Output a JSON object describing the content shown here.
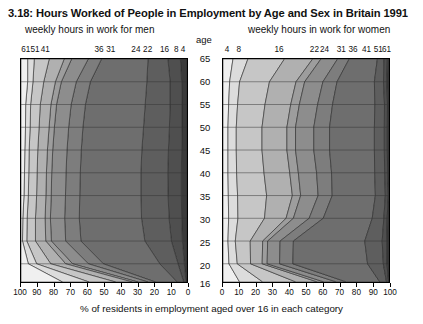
{
  "title": "3.18: Hours Worked of People in Employment by Age and Sex in Britain 1991",
  "captions": {
    "men": "weekly hours in work for men",
    "women": "weekly hours in work for women",
    "age_axis": "age",
    "x_caption": "% of residents in employment aged over 16 in each category"
  },
  "chart_data": {
    "type": "area",
    "title": "3.18: Hours Worked of People in Employment by Age and Sex in Britain 1991",
    "subtitle": "back-to-back stacked percentage area chart by age and sex",
    "xlabel": "% of residents in employment aged over 16 in each category",
    "ylabel": "age",
    "grid": true,
    "legend": "none",
    "orientation": "horizontal-mirrored",
    "ylim": [
      16,
      65
    ],
    "age_ticks": [
      65,
      60,
      55,
      50,
      45,
      40,
      35,
      30,
      25,
      20,
      16
    ],
    "panels": [
      {
        "name": "men",
        "caption": "weekly hours in work for men",
        "x_axis_reversed": true,
        "xlim": [
          0,
          100
        ],
        "x_ticks": [
          100,
          90,
          80,
          70,
          60,
          50,
          40,
          30,
          20,
          10,
          0
        ],
        "hour_boundary_labels": [
          "61",
          "51",
          "41",
          "36",
          "31",
          "24",
          "22",
          "16",
          "8",
          "4"
        ],
        "hour_boundary_label_x_pct": [
          3.5,
          9.0,
          15.0,
          47.0,
          54.0,
          69.0,
          76.0,
          86.0,
          93.0,
          97.0
        ],
        "band_shades": [
          "#3b3b3b",
          "#4f4f4f",
          "#5e5e5e",
          "#6e6e6e",
          "#7d7d7d",
          "#8d8d8d",
          "#9d9d9d",
          "#b0b0b0",
          "#c6c6c6",
          "#dcdcdc",
          "#f0f0f0"
        ],
        "series": [
          {
            "name": "61+ hours",
            "values_by_age": {
              "65": 4.0,
              "60": 3.2,
              "55": 3.0,
              "50": 3.0,
              "45": 3.2,
              "40": 3.4,
              "35": 3.4,
              "30": 3.2,
              "25": 2.8,
              "20": 1.6,
              "16": 0.6
            }
          },
          {
            "name": "51-60 hours",
            "values_by_age": {
              "65": 7.5,
              "60": 7.0,
              "55": 7.2,
              "50": 7.6,
              "45": 8.0,
              "40": 8.2,
              "35": 8.0,
              "30": 7.6,
              "25": 6.6,
              "20": 3.8,
              "16": 1.4
            }
          },
          {
            "name": "41-50 hours",
            "values_by_age": {
              "65": 12.0,
              "60": 14.0,
              "55": 15.0,
              "50": 15.6,
              "45": 16.0,
              "40": 16.2,
              "35": 16.4,
              "30": 16.6,
              "25": 16.0,
              "20": 11.0,
              "16": 4.0
            }
          },
          {
            "name": "36-40 hours",
            "values_by_age": {
              "65": 28.0,
              "60": 34.0,
              "55": 36.0,
              "50": 36.5,
              "45": 36.5,
              "40": 36.5,
              "35": 36.8,
              "30": 37.5,
              "25": 38.5,
              "20": 34.0,
              "16": 13.0
            }
          },
          {
            "name": "31-35 hours",
            "values_by_age": {
              "65": 8.0,
              "60": 8.5,
              "55": 8.6,
              "50": 8.6,
              "45": 8.6,
              "40": 8.6,
              "35": 8.6,
              "30": 8.8,
              "25": 9.2,
              "20": 9.0,
              "16": 4.5
            }
          },
          {
            "name": "24-30 hours",
            "values_by_age": {
              "65": 10.0,
              "60": 9.0,
              "55": 8.8,
              "50": 8.6,
              "45": 8.6,
              "40": 8.6,
              "35": 8.6,
              "30": 8.6,
              "25": 8.6,
              "20": 9.5,
              "16": 6.0
            }
          },
          {
            "name": "22-23 hours",
            "values_by_age": {
              "65": 4.5,
              "60": 3.6,
              "55": 3.4,
              "50": 3.2,
              "45": 3.2,
              "40": 3.2,
              "35": 3.2,
              "30": 3.2,
              "25": 3.4,
              "20": 4.2,
              "16": 3.5
            }
          },
          {
            "name": "16-21 hours",
            "values_by_age": {
              "65": 9.0,
              "60": 7.0,
              "55": 6.4,
              "50": 6.0,
              "45": 5.8,
              "40": 5.6,
              "35": 5.6,
              "30": 5.8,
              "25": 6.2,
              "20": 9.0,
              "16": 10.0
            }
          },
          {
            "name": "8-15 hours",
            "values_by_age": {
              "65": 9.0,
              "60": 6.5,
              "55": 5.8,
              "50": 5.4,
              "45": 5.2,
              "40": 5.0,
              "35": 5.0,
              "30": 5.0,
              "25": 5.2,
              "20": 8.5,
              "16": 16.0
            }
          },
          {
            "name": "4-7 hours",
            "values_by_age": {
              "65": 4.0,
              "60": 3.2,
              "55": 3.0,
              "50": 2.8,
              "45": 2.6,
              "40": 2.6,
              "35": 2.6,
              "30": 2.6,
              "25": 2.6,
              "20": 5.0,
              "16": 16.0
            }
          },
          {
            "name": "0-3 hours",
            "values_by_age": {
              "65": 4.0,
              "60": 4.0,
              "55": 2.8,
              "50": 2.7,
              "45": 2.3,
              "40": 2.1,
              "35": 1.8,
              "30": 1.1,
              "25": 0.9,
              "20": 4.4,
              "16": 25.0
            }
          }
        ]
      },
      {
        "name": "women",
        "caption": "weekly hours in work for women",
        "x_axis_reversed": false,
        "xlim": [
          0,
          100
        ],
        "x_ticks": [
          0,
          10,
          20,
          30,
          40,
          50,
          60,
          70,
          80,
          90,
          100
        ],
        "hour_boundary_labels": [
          "4",
          "8",
          "16",
          "22",
          "24",
          "31",
          "36",
          "41",
          "51",
          "61"
        ],
        "hour_boundary_label_x_pct": [
          3.0,
          10.0,
          34.0,
          55.0,
          61.0,
          71.0,
          78.0,
          86.0,
          93.0,
          98.0
        ],
        "band_shades": [
          "#f0f0f0",
          "#dcdcdc",
          "#c6c6c6",
          "#b0b0b0",
          "#9d9d9d",
          "#8d8d8d",
          "#7d7d7d",
          "#6e6e6e",
          "#5e5e5e",
          "#4f4f4f",
          "#3b3b3b"
        ],
        "series": [
          {
            "name": "0-3 hours",
            "values_by_age": {
              "65": 6.0,
              "60": 4.0,
              "55": 3.4,
              "50": 3.0,
              "45": 3.0,
              "40": 3.0,
              "35": 3.2,
              "30": 3.4,
              "25": 3.0,
              "20": 3.6,
              "16": 10.0
            }
          },
          {
            "name": "4-7 hours",
            "values_by_age": {
              "65": 9.0,
              "60": 6.0,
              "55": 5.4,
              "50": 5.0,
              "45": 5.0,
              "40": 5.2,
              "35": 5.6,
              "30": 5.6,
              "25": 4.4,
              "20": 5.0,
              "16": 14.0
            }
          },
          {
            "name": "8-15 hours",
            "values_by_age": {
              "65": 22.0,
              "60": 18.0,
              "55": 16.5,
              "50": 15.5,
              "45": 15.5,
              "40": 16.5,
              "35": 17.5,
              "30": 16.0,
              "25": 9.0,
              "20": 8.0,
              "16": 20.0
            }
          },
          {
            "name": "16-21 hours",
            "values_by_age": {
              "65": 17.0,
              "60": 16.0,
              "55": 15.5,
              "50": 15.0,
              "45": 15.0,
              "40": 15.5,
              "35": 15.5,
              "30": 13.0,
              "25": 7.5,
              "20": 7.0,
              "16": 13.0
            }
          },
          {
            "name": "22-23 hours",
            "values_by_age": {
              "65": 5.0,
              "60": 5.2,
              "55": 5.2,
              "50": 5.2,
              "45": 5.2,
              "40": 5.2,
              "35": 5.0,
              "30": 4.4,
              "25": 3.0,
              "20": 3.0,
              "16": 4.0
            }
          },
          {
            "name": "24-30 hours",
            "values_by_age": {
              "65": 10.0,
              "60": 11.0,
              "55": 11.0,
              "50": 11.0,
              "45": 11.0,
              "40": 11.0,
              "35": 10.5,
              "30": 9.5,
              "25": 7.5,
              "20": 7.5,
              "16": 7.5
            }
          },
          {
            "name": "31-35 hours",
            "values_by_age": {
              "65": 7.0,
              "60": 8.5,
              "55": 9.0,
              "50": 9.5,
              "45": 9.5,
              "40": 9.0,
              "35": 8.5,
              "30": 8.5,
              "25": 8.0,
              "20": 8.0,
              "16": 6.0
            }
          },
          {
            "name": "36-40 hours",
            "values_by_age": {
              "65": 17.0,
              "60": 22.5,
              "55": 25.5,
              "50": 27.0,
              "45": 27.0,
              "40": 26.0,
              "35": 26.0,
              "30": 29.5,
              "25": 43.0,
              "20": 45.0,
              "16": 20.0
            }
          },
          {
            "name": "41-50 hours",
            "values_by_age": {
              "65": 4.0,
              "60": 5.5,
              "55": 5.8,
              "50": 6.0,
              "45": 6.0,
              "40": 6.0,
              "35": 6.0,
              "30": 7.0,
              "25": 10.5,
              "20": 9.5,
              "16": 4.0
            }
          },
          {
            "name": "51-60 hours",
            "values_by_age": {
              "65": 2.0,
              "60": 2.0,
              "55": 1.8,
              "50": 1.8,
              "45": 1.8,
              "40": 1.8,
              "35": 1.8,
              "30": 2.0,
              "25": 2.8,
              "20": 2.2,
              "16": 1.2
            }
          },
          {
            "name": "61+ hours",
            "values_by_age": {
              "65": 1.0,
              "60": 1.3,
              "55": 0.9,
              "50": 1.0,
              "45": 1.0,
              "40": 0.8,
              "35": 0.4,
              "30": 1.1,
              "25": 1.3,
              "20": 1.2,
              "16": 0.3
            }
          }
        ]
      }
    ]
  }
}
